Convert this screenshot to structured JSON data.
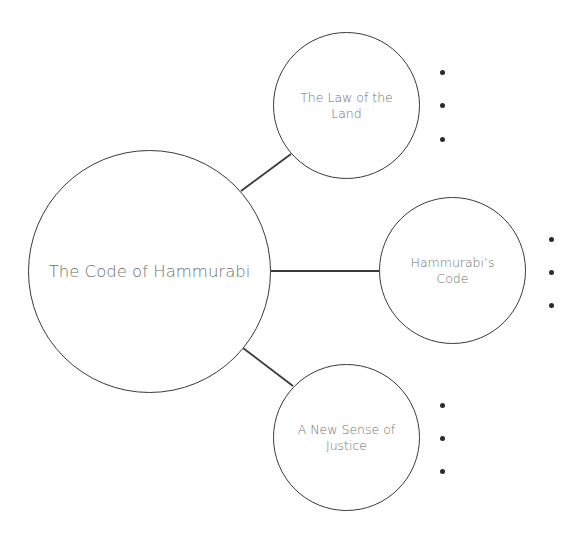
{
  "diagram": {
    "central": {
      "label": "The Code of Hammurabi"
    },
    "branches": [
      {
        "label": "The Law of the Land",
        "bullets": [
          "",
          "",
          ""
        ]
      },
      {
        "label": "Hammurabi’s Code",
        "bullets": [
          "",
          "",
          ""
        ]
      },
      {
        "label": "A New Sense of Justice",
        "bullets": [
          "",
          "",
          ""
        ]
      }
    ],
    "colors": {
      "stroke": "#3a3a3a",
      "text": "#707070",
      "bullet": "#2b2b2b",
      "background": "#ffffff"
    }
  }
}
